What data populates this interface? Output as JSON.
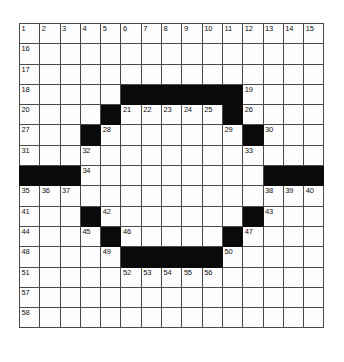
{
  "puzzle": {
    "kind": "crossword-grid",
    "rows": 15,
    "cols": 15,
    "cell_size_px": 20.3,
    "colors": {
      "block": "#0a0a0a",
      "cell": "#fdfdfd",
      "grid_line": "#4a4a4a",
      "number_text": "#111111",
      "page_background": "#ffffff"
    },
    "grid": [
      [
        {
          "num": "1"
        },
        {
          "num": "2"
        },
        {
          "num": "3"
        },
        {
          "num": "4"
        },
        {
          "num": "5"
        },
        {
          "num": "6"
        },
        {
          "num": "7"
        },
        {
          "num": "8"
        },
        {
          "num": "9"
        },
        {
          "num": "10"
        },
        {
          "num": "11"
        },
        {
          "num": "12"
        },
        {
          "num": "13"
        },
        {
          "num": "14"
        },
        {
          "num": "15"
        }
      ],
      [
        {
          "num": "16"
        },
        {},
        {},
        {},
        {},
        {},
        {},
        {},
        {},
        {},
        {},
        {},
        {},
        {},
        {}
      ],
      [
        {
          "num": "17"
        },
        {},
        {},
        {},
        {},
        {},
        {},
        {},
        {},
        {},
        {},
        {},
        {},
        {},
        {}
      ],
      [
        {
          "num": "18"
        },
        {},
        {},
        {},
        {},
        {
          "block": true
        },
        {
          "block": true
        },
        {
          "block": true
        },
        {
          "block": true
        },
        {
          "block": true
        },
        {
          "block": true
        },
        {
          "num": "19"
        },
        {},
        {},
        {}
      ],
      [
        {
          "num": "20"
        },
        {},
        {},
        {},
        {
          "block": true
        },
        {
          "num": "21"
        },
        {
          "num": "22"
        },
        {
          "num": "23"
        },
        {
          "num": "24"
        },
        {
          "num": "25"
        },
        {
          "block": true
        },
        {
          "num": "26"
        },
        {},
        {},
        {}
      ],
      [
        {
          "num": "27"
        },
        {},
        {},
        {
          "block": true
        },
        {
          "num": "28"
        },
        {},
        {},
        {},
        {},
        {},
        {
          "num": "29"
        },
        {
          "block": true
        },
        {
          "num": "30"
        },
        {},
        {}
      ],
      [
        {
          "num": "31"
        },
        {},
        {},
        {
          "num": "32"
        },
        {},
        {},
        {},
        {},
        {},
        {},
        {},
        {
          "num": "33"
        },
        {},
        {},
        {}
      ],
      [
        {
          "block": true
        },
        {
          "block": true
        },
        {
          "block": true
        },
        {
          "num": "34"
        },
        {},
        {},
        {},
        {},
        {},
        {},
        {},
        {},
        {
          "block": true
        },
        {
          "block": true
        },
        {
          "block": true
        }
      ],
      [
        {
          "num": "35"
        },
        {
          "num": "36"
        },
        {
          "num": "37"
        },
        {},
        {},
        {},
        {},
        {},
        {},
        {},
        {},
        {},
        {
          "num": "38"
        },
        {
          "num": "39"
        },
        {
          "num": "40"
        }
      ],
      [
        {
          "num": "41"
        },
        {},
        {},
        {
          "block": true
        },
        {
          "num": "42"
        },
        {},
        {},
        {},
        {},
        {},
        {},
        {
          "block": true
        },
        {
          "num": "43"
        },
        {},
        {}
      ],
      [
        {
          "num": "44"
        },
        {},
        {},
        {
          "num": "45"
        },
        {
          "block": true
        },
        {
          "num": "46"
        },
        {},
        {},
        {},
        {},
        {
          "block": true
        },
        {
          "num": "47"
        },
        {},
        {},
        {}
      ],
      [
        {
          "num": "48"
        },
        {},
        {},
        {},
        {
          "num": "49"
        },
        {
          "block": true
        },
        {
          "block": true
        },
        {
          "block": true
        },
        {
          "block": true
        },
        {
          "block": true
        },
        {
          "num": "50"
        },
        {},
        {},
        {},
        {}
      ],
      [
        {
          "num": "51"
        },
        {},
        {},
        {},
        {},
        {
          "num": "52"
        },
        {
          "num": "53"
        },
        {
          "num": "54"
        },
        {
          "num": "55"
        },
        {
          "num": "56"
        },
        {},
        {},
        {},
        {},
        {}
      ],
      [
        {
          "num": "57"
        },
        {},
        {},
        {},
        {},
        {},
        {},
        {},
        {},
        {},
        {},
        {},
        {},
        {},
        {}
      ],
      [
        {
          "num": "58"
        },
        {},
        {},
        {},
        {},
        {},
        {},
        {},
        {},
        {},
        {},
        {},
        {},
        {},
        {}
      ]
    ]
  }
}
